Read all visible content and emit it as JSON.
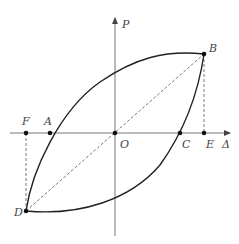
{
  "diagram": {
    "type": "hysteresis loop (load-displacement)",
    "axes": {
      "vertical_label": "P",
      "horizontal_label": "Δ"
    },
    "points": {
      "O": "O",
      "A": "A",
      "B": "B",
      "C": "C",
      "D": "D",
      "E": "E",
      "F": "F"
    },
    "colors": {
      "curve": "#222222",
      "axis": "#777777",
      "dashed": "#555555",
      "label": "#444444"
    }
  }
}
